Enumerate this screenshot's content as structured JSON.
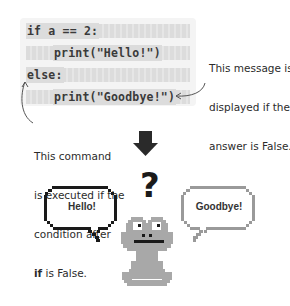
{
  "code": {
    "lines": [
      {
        "text": "if a == 2:",
        "indent": 0
      },
      {
        "text": "print(\"Hello!\")",
        "indent": 1
      },
      {
        "text": "else:",
        "indent": 0
      },
      {
        "text": "print(\"Goodbye!\")",
        "indent": 1
      }
    ]
  },
  "annotations": {
    "false_message": {
      "lines": [
        "This message is",
        "displayed if the",
        "answer is False."
      ],
      "points_to": "print(\"Goodbye!\")"
    },
    "else_command": {
      "lines": [
        "This command",
        "is executed if the",
        "condition after"
      ],
      "last_line_bold": "if",
      "last_line_rest": " is False.",
      "points_to": "else:"
    }
  },
  "illustration": {
    "arrow": "down-arrow",
    "question_mark": "?",
    "bubbles": [
      {
        "text": "Hello!",
        "style": "dark-outline"
      },
      {
        "text": "Goodbye!",
        "style": "gray-outline"
      }
    ],
    "character": "pixel-frog"
  },
  "colors": {
    "code_bg": "#f4f4f4",
    "code_stripe": "#dcdcdc",
    "text": "#2b2b2b",
    "frog": "#a8a8a8",
    "bubble_dark": "#1a1a1a",
    "bubble_gray": "#9a9a9a"
  }
}
